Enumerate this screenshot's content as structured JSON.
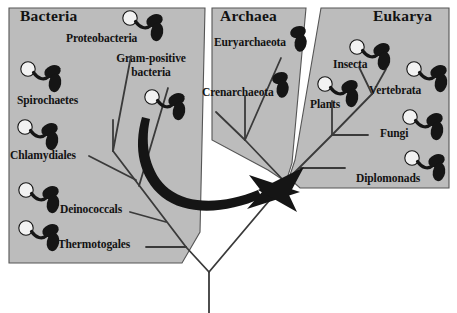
{
  "figure": {
    "type": "phylogenetic-tree-of-life",
    "background_color": "#ffffff",
    "panel_fill": "#bcbcbc",
    "panel_stroke": "#555555",
    "line_color": "#3a3a3a",
    "organism_color": "#151515",
    "nucleus_color": "#f2f2f2",
    "text_color": "#121212"
  },
  "domains": [
    {
      "key": "bacteria",
      "title": "Bacteria",
      "organism_style": "flagellate-with-nucleus",
      "taxa": [
        {
          "key": "proteobacteria",
          "label": "Proteobacteria"
        },
        {
          "key": "gram-positive-bacteria",
          "label": "Gram-positive\nbacteria",
          "line1": "Gram-positive",
          "line2": "bacteria"
        },
        {
          "key": "spirochaetes",
          "label": "Spirochaetes"
        },
        {
          "key": "chlamydiales",
          "label": "Chlamydiales"
        },
        {
          "key": "deinococcals",
          "label": "Deinococcals"
        },
        {
          "key": "thermotogales",
          "label": "Thermotogales"
        }
      ]
    },
    {
      "key": "archaea",
      "title": "Archaea",
      "organism_style": "двух-cell-simple",
      "taxa": [
        {
          "key": "euryarchaeota",
          "label": "Euryarchaeota"
        },
        {
          "key": "crenarchaeota",
          "label": "Crenarchaeota"
        }
      ]
    },
    {
      "key": "eukarya",
      "title": "Eukarya",
      "organism_style": "flagellate-with-nucleus",
      "taxa": [
        {
          "key": "insecta",
          "label": "Insecta"
        },
        {
          "key": "vertebrata",
          "label": "Vertebrata"
        },
        {
          "key": "plants",
          "label": "Plants"
        },
        {
          "key": "fungi",
          "label": "Fungi"
        },
        {
          "key": "diplomonads",
          "label": "Diplomonads"
        }
      ]
    }
  ],
  "annotations": {
    "arrow": {
      "key": "lateral-gene-transfer-arrow",
      "description": "curved black arrow from Bacteria toward root",
      "color": "#151515"
    },
    "root": {
      "key": "universal-root-trunk",
      "description": "common ancestor trunk at bottom center"
    }
  }
}
